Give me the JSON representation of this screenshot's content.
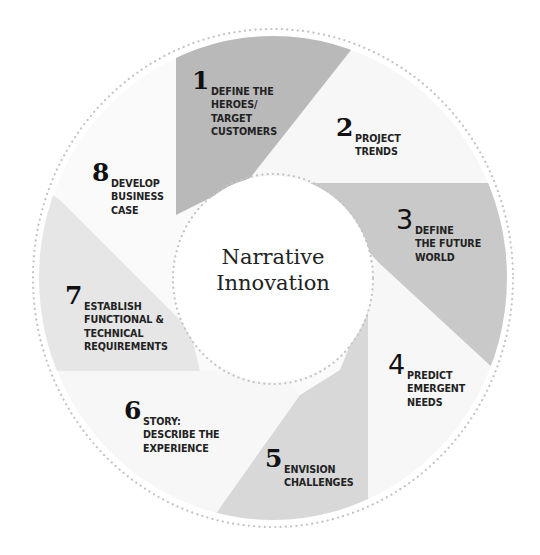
{
  "diagram": {
    "center_title": "Narrative\nInnovation",
    "colors": {
      "seg1": "#b9b9b9",
      "seg2": "#f7f7f7",
      "seg3": "#c9c9c9",
      "seg4": "#f7f7f7",
      "seg5": "#d8d8d8",
      "seg6": "#f7f7f7",
      "seg7": "#e6e6e6",
      "seg8": "#fafafa",
      "dots": "#c4c4c4"
    },
    "steps": [
      {
        "number": "1",
        "label": "Define the\nheroes/\ntarget\ncustomers"
      },
      {
        "number": "2",
        "label": "Project\ntrends"
      },
      {
        "number": "3",
        "label": "Define\nthe future\nworld"
      },
      {
        "number": "4",
        "label": "Predict\nemergent\nneeds"
      },
      {
        "number": "5",
        "label": "Envision\nchallenges"
      },
      {
        "number": "6",
        "label": "Story:\ndescribe the\nexperience"
      },
      {
        "number": "7",
        "label": "Establish\nfunctional &\ntechnical\nrequirements"
      },
      {
        "number": "8",
        "label": "Develop\nbusiness\ncase"
      }
    ]
  }
}
